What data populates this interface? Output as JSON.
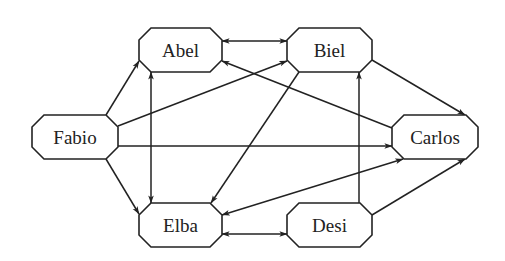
{
  "diagram": {
    "type": "directed-graph",
    "colors": {
      "stroke": "#222222",
      "background": "#ffffff",
      "node_fill": "#ffffff"
    },
    "nodes": [
      {
        "id": "abel",
        "label": "Abel",
        "x": 139,
        "y": 28,
        "w": 83,
        "h": 44
      },
      {
        "id": "biel",
        "label": "Biel",
        "x": 287,
        "y": 28,
        "w": 85,
        "h": 44
      },
      {
        "id": "fabio",
        "label": "Fabio",
        "x": 32,
        "y": 115,
        "w": 86,
        "h": 44
      },
      {
        "id": "carlos",
        "label": "Carlos",
        "x": 392,
        "y": 115,
        "w": 86,
        "h": 44
      },
      {
        "id": "elba",
        "label": "Elba",
        "x": 139,
        "y": 203,
        "w": 83,
        "h": 44
      },
      {
        "id": "desi",
        "label": "Desi",
        "x": 287,
        "y": 203,
        "w": 85,
        "h": 44
      }
    ],
    "edges": [
      {
        "from": "fabio",
        "to": "abel",
        "bidirectional": false
      },
      {
        "from": "fabio",
        "to": "biel",
        "bidirectional": false
      },
      {
        "from": "fabio",
        "to": "carlos",
        "bidirectional": false
      },
      {
        "from": "fabio",
        "to": "elba",
        "bidirectional": false
      },
      {
        "from": "abel",
        "to": "biel",
        "bidirectional": true
      },
      {
        "from": "abel",
        "to": "elba",
        "bidirectional": true
      },
      {
        "from": "carlos",
        "to": "abel",
        "bidirectional": false
      },
      {
        "from": "biel",
        "to": "carlos",
        "bidirectional": false
      },
      {
        "from": "desi",
        "to": "biel",
        "bidirectional": false
      },
      {
        "from": "biel",
        "to": "elba",
        "bidirectional": false
      },
      {
        "from": "elba",
        "to": "carlos",
        "bidirectional": true
      },
      {
        "from": "elba",
        "to": "desi",
        "bidirectional": true
      },
      {
        "from": "desi",
        "to": "carlos",
        "bidirectional": false
      }
    ]
  }
}
